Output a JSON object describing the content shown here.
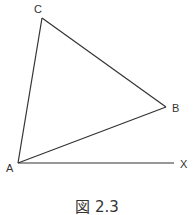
{
  "figure": {
    "caption": "図 2.3",
    "line_color": "#333333",
    "points": {
      "A": {
        "label": "A",
        "x": 18,
        "y": 163
      },
      "B": {
        "label": "B",
        "x": 166,
        "y": 107
      },
      "C": {
        "label": "C",
        "x": 42,
        "y": 18
      },
      "X": {
        "label": "X",
        "x": 174,
        "y": 163
      }
    },
    "segments": [
      "AC",
      "CB",
      "BA",
      "AX"
    ]
  }
}
